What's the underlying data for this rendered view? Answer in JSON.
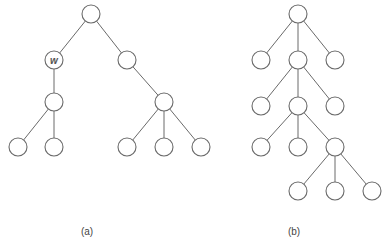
{
  "figure": {
    "panels": [
      {
        "id": "a",
        "caption": "(a)",
        "caption_pos": [
          87,
          226
        ],
        "nodes": [
          {
            "id": "a0",
            "x": 91,
            "y": 14,
            "label": ""
          },
          {
            "id": "a1",
            "x": 54,
            "y": 60,
            "label": "w"
          },
          {
            "id": "a2",
            "x": 127,
            "y": 60,
            "label": ""
          },
          {
            "id": "a3",
            "x": 54,
            "y": 102,
            "label": ""
          },
          {
            "id": "a4",
            "x": 164,
            "y": 102,
            "label": ""
          },
          {
            "id": "a5",
            "x": 18,
            "y": 147,
            "label": ""
          },
          {
            "id": "a6",
            "x": 54,
            "y": 147,
            "label": ""
          },
          {
            "id": "a7",
            "x": 127,
            "y": 147,
            "label": ""
          },
          {
            "id": "a8",
            "x": 164,
            "y": 147,
            "label": ""
          },
          {
            "id": "a9",
            "x": 201,
            "y": 147,
            "label": ""
          }
        ],
        "edges": [
          [
            "a0",
            "a1"
          ],
          [
            "a0",
            "a2"
          ],
          [
            "a1",
            "a3"
          ],
          [
            "a2",
            "a4"
          ],
          [
            "a3",
            "a5"
          ],
          [
            "a3",
            "a6"
          ],
          [
            "a4",
            "a7"
          ],
          [
            "a4",
            "a8"
          ],
          [
            "a4",
            "a9"
          ]
        ]
      },
      {
        "id": "b",
        "caption": "(b)",
        "caption_pos": [
          294,
          226
        ],
        "nodes": [
          {
            "id": "b0",
            "x": 298,
            "y": 14,
            "label": ""
          },
          {
            "id": "b1",
            "x": 261,
            "y": 60,
            "label": ""
          },
          {
            "id": "b2",
            "x": 298,
            "y": 60,
            "label": ""
          },
          {
            "id": "b3",
            "x": 335,
            "y": 60,
            "label": ""
          },
          {
            "id": "b4",
            "x": 261,
            "y": 106,
            "label": ""
          },
          {
            "id": "b5",
            "x": 298,
            "y": 106,
            "label": ""
          },
          {
            "id": "b6",
            "x": 335,
            "y": 106,
            "label": ""
          },
          {
            "id": "b7",
            "x": 261,
            "y": 147,
            "label": ""
          },
          {
            "id": "b8",
            "x": 298,
            "y": 147,
            "label": ""
          },
          {
            "id": "b9",
            "x": 335,
            "y": 147,
            "label": ""
          },
          {
            "id": "b10",
            "x": 298,
            "y": 191,
            "label": ""
          },
          {
            "id": "b11",
            "x": 335,
            "y": 191,
            "label": ""
          },
          {
            "id": "b12",
            "x": 372,
            "y": 191,
            "label": ""
          }
        ],
        "edges": [
          [
            "b0",
            "b1"
          ],
          [
            "b0",
            "b2"
          ],
          [
            "b0",
            "b3"
          ],
          [
            "b2",
            "b4"
          ],
          [
            "b2",
            "b5"
          ],
          [
            "b2",
            "b6"
          ],
          [
            "b5",
            "b7"
          ],
          [
            "b5",
            "b8"
          ],
          [
            "b5",
            "b9"
          ],
          [
            "b9",
            "b10"
          ],
          [
            "b9",
            "b11"
          ],
          [
            "b9",
            "b12"
          ]
        ]
      }
    ],
    "node_radius": 9,
    "stroke_color": "#6a6a6a"
  }
}
